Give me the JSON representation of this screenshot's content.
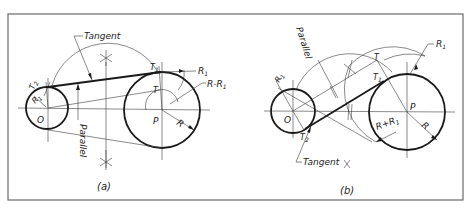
{
  "figure": {
    "panels": [
      {
        "id": "a",
        "caption": "(a)",
        "labels": {
          "tangent": "Tangent",
          "parallel": "Parallel",
          "t1": "T",
          "t1_sub": "1",
          "t2": "T",
          "t2_sub": "2",
          "t": "T",
          "r1": "R",
          "r1_sub": "1",
          "r1_small": "R",
          "r1_small_sub": "1",
          "r_minus_r1": "R-R",
          "r_minus_r1_sub": "1",
          "r": "R",
          "o": "O",
          "p": "P"
        }
      },
      {
        "id": "b",
        "caption": "(b)",
        "labels": {
          "tangent": "Tangent",
          "parallel": "Parallel",
          "t1": "T",
          "t1_sub": "1",
          "t2": "T",
          "t2_sub": "2",
          "t": "T",
          "r1": "R",
          "r1_sub": "1",
          "r1_small": "R",
          "r1_small_sub": "1",
          "r_plus_r1": "R+R",
          "r_plus_r1_sub": "1",
          "r": "R",
          "o": "O",
          "p": "P"
        }
      }
    ],
    "colors": {
      "line": "#1a1a1a",
      "frame": "#6a6a6a",
      "background": "#ffffff"
    }
  }
}
